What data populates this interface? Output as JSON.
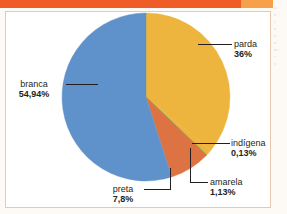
{
  "figure": {
    "frame_border_color": "#e8c9ad",
    "top_bar_color": "#ef5c28",
    "background_color": "#ffffff"
  },
  "chart_data": {
    "type": "pie",
    "title": "",
    "subtitle": "",
    "xlabel": "",
    "ylabel": "",
    "legend_position": "callout-labels",
    "grid": false,
    "categories": [
      "branca",
      "parda",
      "preta",
      "amarela",
      "indígena"
    ],
    "values": [
      54.94,
      36,
      7.8,
      1.13,
      0.13
    ],
    "value_labels": [
      "54,94%",
      "36%",
      "7,8%",
      "1,13%",
      "0,13%"
    ],
    "colors": [
      "#5f92ca",
      "#edb53d",
      "#dd7242",
      "#5f92ca",
      "#3f9d4f"
    ],
    "slices": [
      {
        "name": "parda",
        "value": 36,
        "label": "parda",
        "value_label": "36%",
        "color": "#edb53d"
      },
      {
        "name": "amarela",
        "value": 1.13,
        "label": "amarela",
        "value_label": "1,13%",
        "color": "#edb53d"
      },
      {
        "name": "indigena",
        "value": 0.13,
        "label": "indígena",
        "value_label": "0,13%",
        "color": "#3f9d4f"
      },
      {
        "name": "preta",
        "value": 7.8,
        "label": "preta",
        "value_label": "7,8%",
        "color": "#dd7242"
      },
      {
        "name": "branca",
        "value": 54.94,
        "label": "branca",
        "value_label": "54,94%",
        "color": "#5f92ca"
      }
    ]
  },
  "bleed_text": {
    "lines": [
      "a",
      "n",
      "t",
      "e",
      "s",
      "o",
      "m",
      "r",
      "e"
    ]
  }
}
